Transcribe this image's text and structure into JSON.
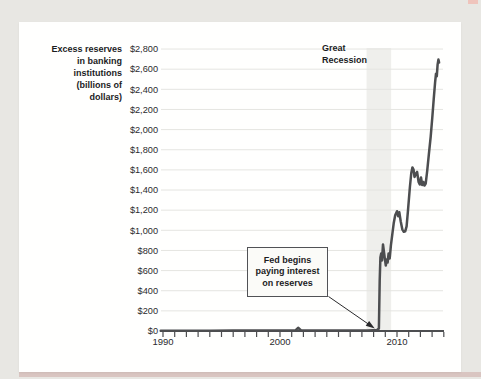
{
  "page": {
    "background_color": "#e8e7e3",
    "panel_color": "#fffffe",
    "accent_strip_color": "#d9c5c1"
  },
  "labels": {
    "y_axis_title": "Excess reserves\nin banking\ninstitutions\n(billions of\ndollars)",
    "recession": "Great\nRecession",
    "callout": "Fed begins\npaying interest\non reserves"
  },
  "chart_data": {
    "type": "line",
    "title": "",
    "xlabel": "",
    "ylabel": "Excess reserves in banking institutions (billions of dollars)",
    "x_range": [
      1989.8,
      2014.2
    ],
    "ylim": [
      0,
      2800
    ],
    "y_tick_step": 200,
    "y_tick_values": [
      0,
      200,
      400,
      600,
      800,
      1000,
      1200,
      1400,
      1600,
      1800,
      2000,
      2200,
      2400,
      2600,
      2800
    ],
    "y_tick_labels": [
      "$0",
      "$200",
      "$400",
      "$600",
      "$800",
      "$1,000",
      "$1,200",
      "$1,400",
      "$1,600",
      "$1,800",
      "$2,000",
      "$2,200",
      "$2,400",
      "$2,600",
      "$2,800"
    ],
    "x_tick_years": [
      1990,
      1991,
      1992,
      1993,
      1994,
      1995,
      1996,
      1997,
      1998,
      1999,
      2000,
      2001,
      2002,
      2003,
      2004,
      2005,
      2006,
      2007,
      2008,
      2009,
      2010,
      2011,
      2012,
      2013,
      2014
    ],
    "x_labeled_ticks": [
      1990,
      2000,
      2010
    ],
    "grid": "horizontal",
    "line_color": "#4d4e50",
    "grid_color": "#e5e5e1",
    "series": [
      {
        "name": "Excess reserves",
        "points": [
          [
            1989.8,
            3
          ],
          [
            1992,
            3
          ],
          [
            1994,
            3
          ],
          [
            1996,
            4
          ],
          [
            1998,
            4
          ],
          [
            2000,
            4
          ],
          [
            2001.3,
            4
          ],
          [
            2001.55,
            32
          ],
          [
            2001.8,
            5
          ],
          [
            2004,
            5
          ],
          [
            2006,
            5
          ],
          [
            2007.5,
            6
          ],
          [
            2008.3,
            10
          ],
          [
            2008.45,
            25
          ],
          [
            2008.52,
            500
          ],
          [
            2008.58,
            730
          ],
          [
            2008.65,
            770
          ],
          [
            2008.72,
            700
          ],
          [
            2008.8,
            860
          ],
          [
            2008.88,
            790
          ],
          [
            2008.96,
            720
          ],
          [
            2009.04,
            650
          ],
          [
            2009.12,
            710
          ],
          [
            2009.2,
            680
          ],
          [
            2009.28,
            770
          ],
          [
            2009.38,
            720
          ],
          [
            2009.48,
            850
          ],
          [
            2009.6,
            960
          ],
          [
            2009.72,
            1070
          ],
          [
            2009.85,
            1150
          ],
          [
            2010.0,
            1190
          ],
          [
            2010.1,
            1140
          ],
          [
            2010.2,
            1180
          ],
          [
            2010.32,
            1090
          ],
          [
            2010.45,
            1010
          ],
          [
            2010.58,
            985
          ],
          [
            2010.7,
            990
          ],
          [
            2010.82,
            1040
          ],
          [
            2010.95,
            1210
          ],
          [
            2011.1,
            1430
          ],
          [
            2011.22,
            1570
          ],
          [
            2011.32,
            1625
          ],
          [
            2011.42,
            1600
          ],
          [
            2011.5,
            1530
          ],
          [
            2011.62,
            1565
          ],
          [
            2011.72,
            1580
          ],
          [
            2011.85,
            1480
          ],
          [
            2011.95,
            1455
          ],
          [
            2012.05,
            1525
          ],
          [
            2012.15,
            1450
          ],
          [
            2012.25,
            1480
          ],
          [
            2012.35,
            1445
          ],
          [
            2012.45,
            1465
          ],
          [
            2012.58,
            1590
          ],
          [
            2012.72,
            1750
          ],
          [
            2012.88,
            1930
          ],
          [
            2013.02,
            2120
          ],
          [
            2013.14,
            2300
          ],
          [
            2013.26,
            2470
          ],
          [
            2013.33,
            2555
          ],
          [
            2013.4,
            2530
          ],
          [
            2013.47,
            2645
          ],
          [
            2013.54,
            2695
          ],
          [
            2013.6,
            2665
          ]
        ]
      }
    ],
    "annotations": [
      {
        "type": "band",
        "label": "Great Recession",
        "from": 2007.4,
        "to": 2009.5,
        "color": "#efefec"
      },
      {
        "type": "callout",
        "text": "Fed begins paying interest on reserves",
        "arrow_target_year": 2008.1,
        "arrow_target_value": 25
      }
    ]
  }
}
